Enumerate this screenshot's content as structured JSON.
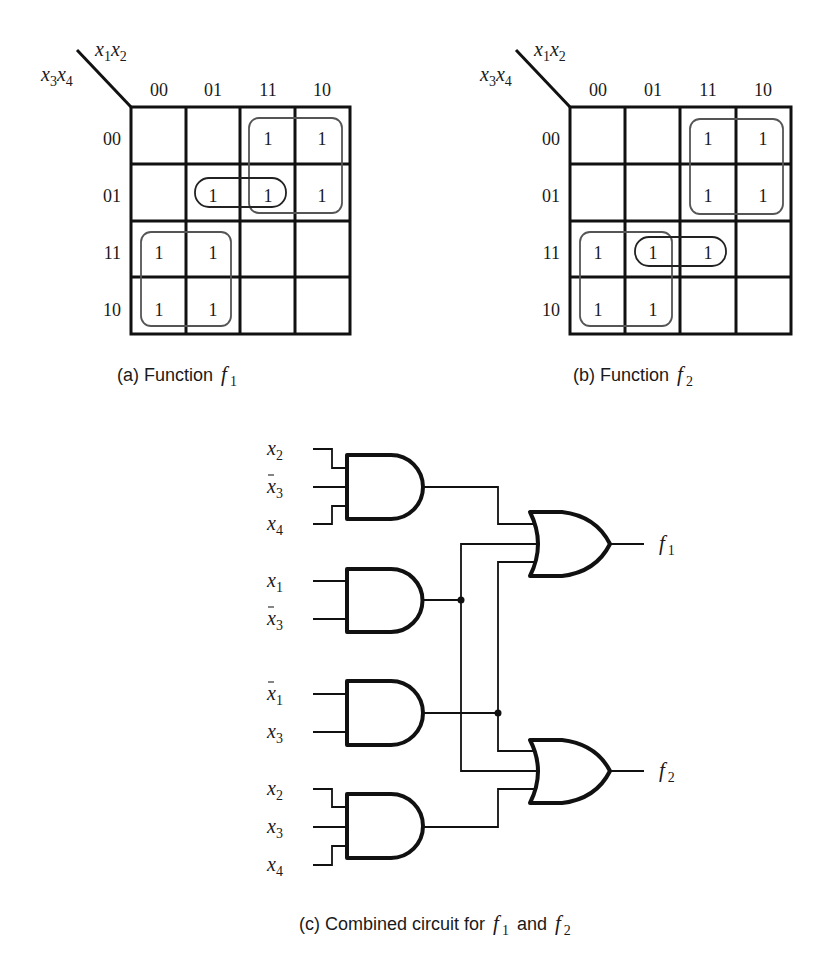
{
  "kmaps": [
    {
      "id": "a",
      "caption_prefix": "(a) Function",
      "caption_fn": "f",
      "caption_sub": "1",
      "col_var": {
        "a": "x",
        "a_sub": "1",
        "b": "x",
        "b_sub": "2"
      },
      "row_var": {
        "a": "x",
        "a_sub": "3",
        "b": "x",
        "b_sub": "4"
      },
      "col_labels": [
        "00",
        "01",
        "11",
        "10"
      ],
      "row_labels": [
        "00",
        "01",
        "11",
        "10"
      ],
      "cells": [
        [
          "",
          "",
          "1",
          "1"
        ],
        [
          "",
          "1",
          "1",
          "1"
        ],
        [
          "1",
          "1",
          "",
          ""
        ],
        [
          "1",
          "1",
          "",
          ""
        ]
      ],
      "groups": [
        "x1·x̄3 (cols 11,10 rows 00,01)",
        "x2·x̄3·x4 (row 01 cols 01,11)",
        "x̄1·x3 (cols 00,01 rows 11,10)"
      ]
    },
    {
      "id": "b",
      "caption_prefix": "(b) Function",
      "caption_fn": "f",
      "caption_sub": "2",
      "col_var": {
        "a": "x",
        "a_sub": "1",
        "b": "x",
        "b_sub": "2"
      },
      "row_var": {
        "a": "x",
        "a_sub": "3",
        "b": "x",
        "b_sub": "4"
      },
      "col_labels": [
        "00",
        "01",
        "11",
        "10"
      ],
      "row_labels": [
        "00",
        "01",
        "11",
        "10"
      ],
      "cells": [
        [
          "",
          "",
          "1",
          "1"
        ],
        [
          "",
          "",
          "1",
          "1"
        ],
        [
          "1",
          "1",
          "1",
          ""
        ],
        [
          "1",
          "1",
          "",
          ""
        ]
      ],
      "groups": [
        "x1·x̄3 (cols 11,10 rows 00,01)",
        "x̄1·x3 (cols 00,01 rows 11,10)",
        "x2·x3·x4 (row 11 cols 01,11)"
      ]
    }
  ],
  "circuit": {
    "caption_prefix": "(c) Combined circuit for",
    "caption_f1": "f",
    "caption_f1_sub": "1",
    "caption_and": "and",
    "caption_f2": "f",
    "caption_f2_sub": "2",
    "and_gates": [
      {
        "inputs": [
          {
            "v": "x",
            "sub": "2",
            "bar": false
          },
          {
            "v": "x",
            "sub": "3",
            "bar": true
          },
          {
            "v": "x",
            "sub": "4",
            "bar": false
          }
        ]
      },
      {
        "inputs": [
          {
            "v": "x",
            "sub": "1",
            "bar": false
          },
          {
            "v": "x",
            "sub": "3",
            "bar": true
          }
        ]
      },
      {
        "inputs": [
          {
            "v": "x",
            "sub": "1",
            "bar": true
          },
          {
            "v": "x",
            "sub": "3",
            "bar": false
          }
        ]
      },
      {
        "inputs": [
          {
            "v": "x",
            "sub": "2",
            "bar": false
          },
          {
            "v": "x",
            "sub": "3",
            "bar": false
          },
          {
            "v": "x",
            "sub": "4",
            "bar": false
          }
        ]
      }
    ],
    "outputs": [
      {
        "name": "f",
        "sub": "1"
      },
      {
        "name": "f",
        "sub": "2"
      }
    ]
  }
}
